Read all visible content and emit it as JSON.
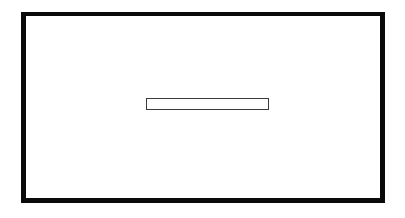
{
  "figure": {
    "type": "line-drawing",
    "background_color": "#ffffff",
    "canvas": {
      "width": 405,
      "height": 218
    },
    "shapes": [
      {
        "name": "outer-frame",
        "kind": "rectangle",
        "x": 21,
        "y": 12,
        "width": 364,
        "height": 191,
        "stroke_color": "#0a0a0a",
        "stroke_width": 5,
        "fill_color": "#ffffff",
        "label": ""
      },
      {
        "name": "inner-slot",
        "kind": "rectangle",
        "x": 141,
        "y": 94,
        "width": 123,
        "height": 12,
        "stroke_color": "#3b3b3b",
        "stroke_width": 1,
        "fill_color": "#ffffff",
        "label": ""
      }
    ]
  }
}
